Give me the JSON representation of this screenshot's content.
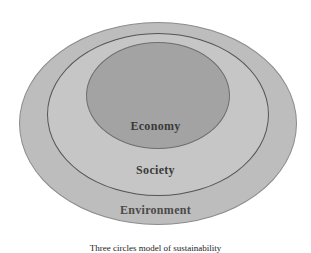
{
  "diagram": {
    "type": "nested-ellipses",
    "layers": [
      {
        "name": "Environment",
        "role": "outer",
        "fill": "#bdbdbd"
      },
      {
        "name": "Society",
        "role": "middle",
        "fill": "#c6c6c6"
      },
      {
        "name": "Economy",
        "role": "inner",
        "fill": "#a3a3a3"
      }
    ],
    "labels": {
      "economy": "Economy",
      "society": "Society",
      "environment": "Environment"
    },
    "caption": "Three circles model of sustainability"
  }
}
